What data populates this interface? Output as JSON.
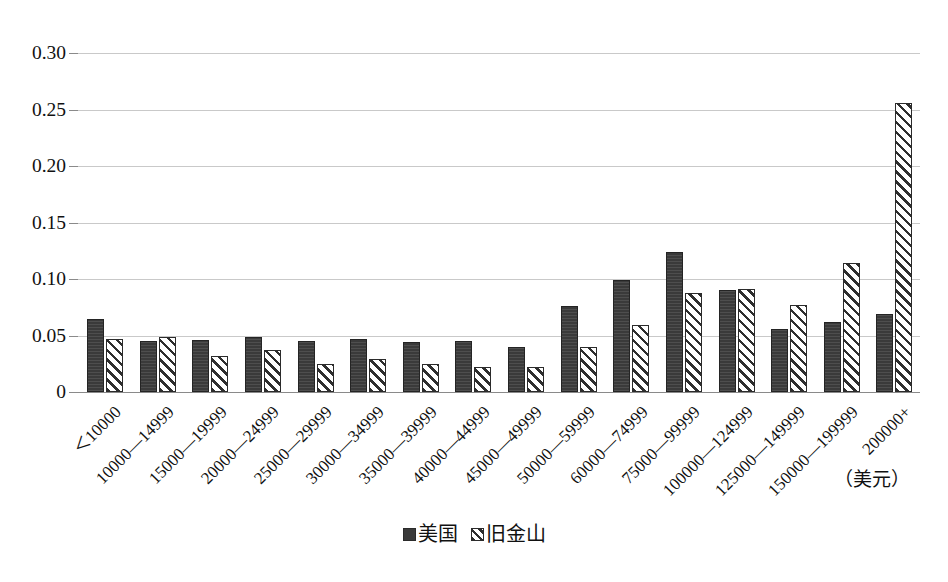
{
  "chart_data": {
    "type": "bar",
    "title": "",
    "subtitle": "",
    "xlabel": "",
    "ylabel": "",
    "unit_note": "（美元）",
    "ylim": [
      0,
      0.3
    ],
    "yticks": [
      "0",
      "0.05",
      "0.10",
      "0.15",
      "0.20",
      "0.25",
      "0.30"
    ],
    "ytick_values": [
      0,
      0.05,
      0.1,
      0.15,
      0.2,
      0.25,
      0.3
    ],
    "grid": true,
    "legend_position": "bottom",
    "categories": [
      "＜10000",
      "10000—14999",
      "15000—19999",
      "20000—24999",
      "25000—29999",
      "30000—34999",
      "35000—39999",
      "40000—44999",
      "45000—49999",
      "50000—59999",
      "60000—74999",
      "75000—99999",
      "100000—124999",
      "125000—149999",
      "150000—199999",
      "200000+"
    ],
    "series": [
      {
        "name": "美国",
        "style": "solid",
        "color": "#3a3a3a",
        "values": [
          0.065,
          0.045,
          0.046,
          0.049,
          0.045,
          0.047,
          0.044,
          0.045,
          0.04,
          0.076,
          0.099,
          0.124,
          0.09,
          0.056,
          0.062,
          0.069
        ]
      },
      {
        "name": "旧金山",
        "style": "hatched",
        "color": "#2e2e2e",
        "values": [
          0.047,
          0.049,
          0.032,
          0.037,
          0.025,
          0.029,
          0.025,
          0.022,
          0.022,
          0.04,
          0.059,
          0.088,
          0.091,
          0.077,
          0.114,
          0.256
        ]
      }
    ]
  },
  "legend": {
    "items": [
      {
        "label": "美国",
        "style": "solid"
      },
      {
        "label": "旧金山",
        "style": "hatched"
      }
    ]
  },
  "axis": {
    "y_tick_labels": [
      "0.30",
      "0.25",
      "0.20",
      "0.15",
      "0.10",
      "0.05",
      "0"
    ],
    "unit_annotation": "（美元）"
  }
}
